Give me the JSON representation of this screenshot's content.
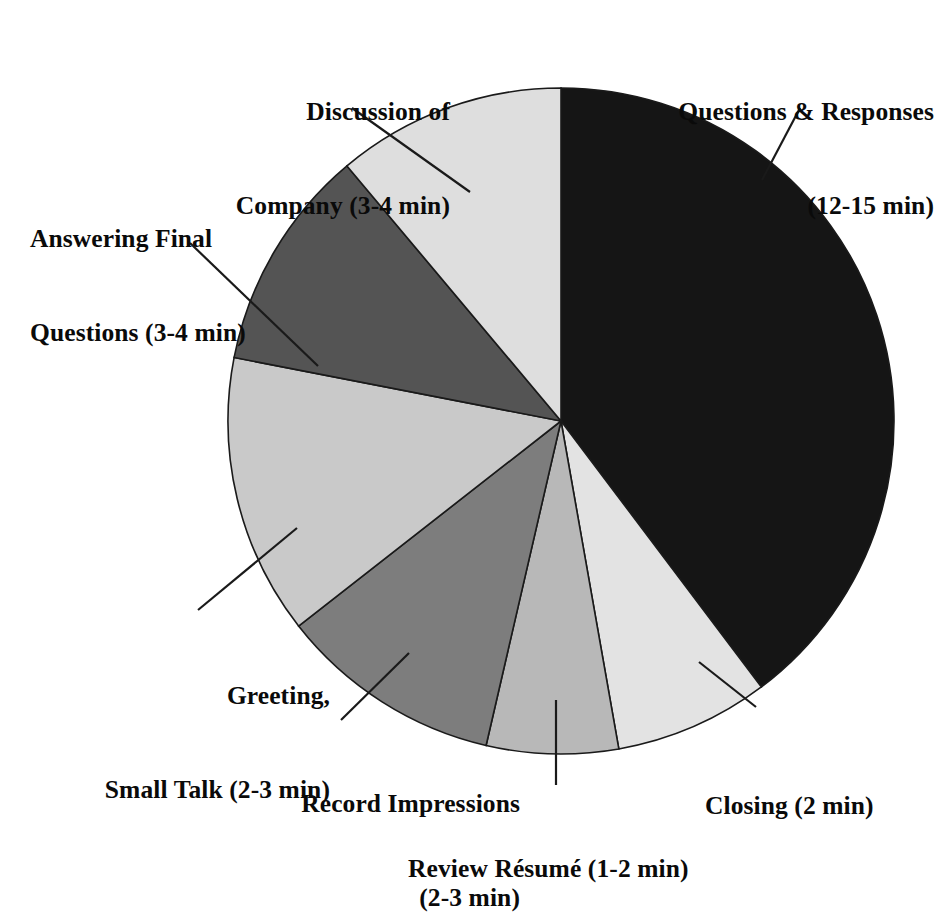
{
  "figure": {
    "kind": "pie-chart",
    "background_color": "#ffffff",
    "text_color": "#0a0a0a",
    "outline_color": "#1a1a1a"
  },
  "chart_data": {
    "type": "pie",
    "title": "",
    "xlabel": "",
    "ylabel": "",
    "units": "minutes",
    "legend_position": "none",
    "grid": false,
    "start_angle_deg": 0,
    "direction": "clockwise",
    "labels": [
      "Questions & Responses (12-15 min)",
      "Closing (2 min)",
      "Review Résumé (1-2 min)",
      "Record Impressions (2-3 min)",
      "Greeting, Small Talk (2-3 min)",
      "Answering Final Questions (3-4 min)",
      "Discussion of Company (3-4 min)"
    ],
    "categories": [
      "Questions & Responses",
      "Closing",
      "Review Résumé",
      "Record Impressions",
      "Greeting, Small Talk",
      "Answering Final Questions",
      "Discussion of Company"
    ],
    "values": [
      13.5,
      2,
      1.5,
      2.5,
      3.5,
      3.5,
      3.5
    ],
    "value_ranges": [
      "12-15",
      "2",
      "1-2",
      "2-3",
      "2-3",
      "3-4",
      "3-4"
    ],
    "angles_deg": [
      143,
      27,
      23,
      39,
      49,
      39,
      40
    ],
    "colors": [
      "#151515",
      "#e3e3e3",
      "#b8b8b8",
      "#7d7d7d",
      "#c9c9c9",
      "#545454",
      "#dedede"
    ],
    "slices": [
      {
        "label": "Questions & Responses",
        "duration": "12-15 min",
        "start_deg": 0,
        "end_deg": 143,
        "color": "#151515"
      },
      {
        "label": "Closing",
        "duration": "2 min",
        "start_deg": 143,
        "end_deg": 170,
        "color": "#e3e3e3"
      },
      {
        "label": "Review Résumé",
        "duration": "1-2 min",
        "start_deg": 170,
        "end_deg": 193,
        "color": "#b8b8b8"
      },
      {
        "label": "Record Impressions",
        "duration": "2-3 min",
        "start_deg": 193,
        "end_deg": 232,
        "color": "#7d7d7d"
      },
      {
        "label": "Greeting, Small Talk",
        "duration": "2-3 min",
        "start_deg": 232,
        "end_deg": 281,
        "color": "#c9c9c9"
      },
      {
        "label": "Answering Final Questions",
        "duration": "3-4 min",
        "start_deg": 281,
        "end_deg": 320,
        "color": "#545454"
      },
      {
        "label": "Discussion of Company",
        "duration": "3-4 min",
        "start_deg": 320,
        "end_deg": 360,
        "color": "#dedede"
      }
    ]
  },
  "callouts": {
    "questions_responses": {
      "line1": "Questions & Responses",
      "line2": "(12-15 min)"
    },
    "discussion_company": {
      "line1": "Discussion of",
      "line2": "Company (3-4 min)"
    },
    "answering_final": {
      "line1": "Answering Final",
      "line2": "Questions (3-4 min)"
    },
    "greeting_small_talk": {
      "line1": "Greeting,",
      "line2": "Small Talk (2-3 min)"
    },
    "record_impressions": {
      "line1": "Record Impressions",
      "line2": "(2-3 min)"
    },
    "review_resume": {
      "line1": "Review Résumé (1-2 min)",
      "line2": ""
    },
    "closing": {
      "line1": "Closing (2 min)",
      "line2": ""
    }
  }
}
